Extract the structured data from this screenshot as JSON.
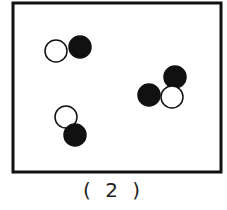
{
  "figure": {
    "caption": "( 2 )",
    "box": {
      "x": 13,
      "y": 3,
      "width": 208,
      "height": 169,
      "stroke": "#111111",
      "stroke_width": 3
    },
    "colors": {
      "filled": "#111111",
      "hollow": "#ffffff",
      "outline": "#111111"
    },
    "molecules": [
      {
        "name": "molecule-top-left",
        "atoms": [
          {
            "type": "hollow",
            "cx": 56,
            "cy": 51,
            "r": 11
          },
          {
            "type": "filled",
            "cx": 80,
            "cy": 47,
            "r": 11
          }
        ]
      },
      {
        "name": "molecule-right",
        "atoms": [
          {
            "type": "filled",
            "cx": 175,
            "cy": 77,
            "r": 11
          },
          {
            "type": "hollow",
            "cx": 172,
            "cy": 97,
            "r": 11
          },
          {
            "type": "filled",
            "cx": 149,
            "cy": 95,
            "r": 11
          }
        ]
      },
      {
        "name": "molecule-bottom",
        "atoms": [
          {
            "type": "hollow",
            "cx": 66,
            "cy": 117,
            "r": 11
          },
          {
            "type": "filled",
            "cx": 75,
            "cy": 135,
            "r": 11
          }
        ]
      }
    ]
  }
}
